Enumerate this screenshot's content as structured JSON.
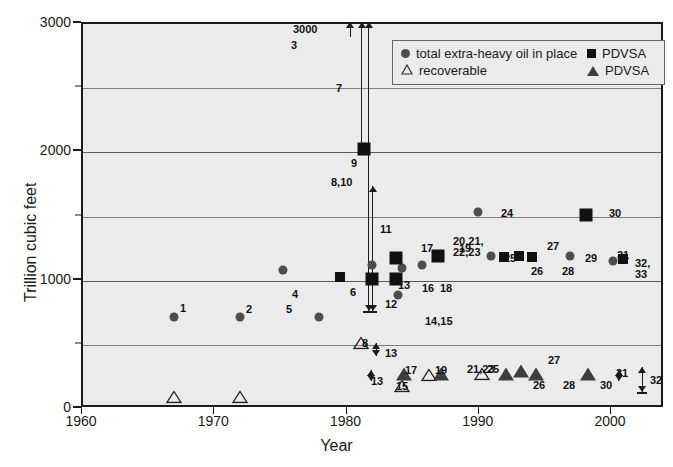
{
  "chart_data": {
    "type": "scatter",
    "title": "",
    "xlabel": "Year",
    "ylabel": "Trillion cubic feet",
    "xlim": [
      1960,
      2004
    ],
    "ylim": [
      0,
      3000
    ],
    "xticks": [
      1960,
      1970,
      1980,
      1990,
      2000
    ],
    "yticks": [
      0,
      1000,
      2000,
      3000
    ],
    "yminor": [
      500,
      1500,
      2500
    ],
    "grid": true,
    "legend_position": "top-right",
    "series": [
      {
        "name": "total extra-heavy oil in place",
        "marker": "circle",
        "points": [
          {
            "ref": "1",
            "x": 1967.0,
            "y": 700
          },
          {
            "ref": "2",
            "x": 1972.0,
            "y": 700
          },
          {
            "ref": "4",
            "x": 1975.3,
            "y": 1065
          },
          {
            "ref": "5",
            "x": 1978.0,
            "y": 700
          },
          {
            "ref": "13",
            "x": 1982.0,
            "y": 1105
          },
          {
            "ref": "18",
            "x": 1984.3,
            "y": 1080
          },
          {
            "ref": "14,15",
            "x": 1984.0,
            "y": 870
          },
          {
            "ref": "19",
            "x": 1985.8,
            "y": 1110
          },
          {
            "ref": "24",
            "x": 1990.0,
            "y": 1520
          },
          {
            "ref": "25",
            "x": 1991.0,
            "y": 1175
          },
          {
            "ref": "29",
            "x": 1997.0,
            "y": 1180
          },
          {
            "ref": "31",
            "x": 2000.2,
            "y": 1140
          }
        ]
      },
      {
        "name": "recoverable",
        "marker": "triangle-open",
        "points": [
          {
            "ref": "1",
            "x": 1967.0,
            "y": 75
          },
          {
            "ref": "2",
            "x": 1972.0,
            "y": 75
          },
          {
            "ref": "8",
            "x": 1981.2,
            "y": 500
          },
          {
            "ref": "15",
            "x": 1984.3,
            "y": 160
          },
          {
            "ref": "19",
            "x": 1986.3,
            "y": 250
          },
          {
            "ref": "25",
            "x": 1990.3,
            "y": 255
          }
        ]
      },
      {
        "name": "PDVSA",
        "marker": "square",
        "points": [
          {
            "ref": "6",
            "x": 1979.6,
            "y": 1010
          },
          {
            "ref": "9",
            "x": 1981.4,
            "y": 2010
          },
          {
            "ref": "12",
            "x": 1982.0,
            "y": 1000
          },
          {
            "ref": "16",
            "x": 1983.8,
            "y": 1000
          },
          {
            "ref": "17",
            "x": 1983.8,
            "y": 1160
          },
          {
            "ref": "20,21,22,23",
            "x": 1987.0,
            "y": 1175
          },
          {
            "ref": "26",
            "x": 1992.0,
            "y": 1165
          },
          {
            "ref": "27",
            "x": 1993.1,
            "y": 1180
          },
          {
            "ref": "28",
            "x": 1994.1,
            "y": 1165
          },
          {
            "ref": "30",
            "x": 1998.2,
            "y": 1500
          },
          {
            "ref": "32,33",
            "x": 2001.0,
            "y": 1155
          }
        ]
      },
      {
        "name": "PDVSA",
        "marker": "triangle-filled",
        "points": [
          {
            "ref": "17",
            "x": 1984.4,
            "y": 255
          },
          {
            "ref": "21,23",
            "x": 1987.2,
            "y": 255
          },
          {
            "ref": "26",
            "x": 1992.1,
            "y": 255
          },
          {
            "ref": "27",
            "x": 1993.3,
            "y": 280
          },
          {
            "ref": "28",
            "x": 1994.4,
            "y": 255
          },
          {
            "ref": "30",
            "x": 1998.3,
            "y": 255
          }
        ]
      }
    ],
    "annotations": [
      {
        "ref": "3",
        "x": 1980.3,
        "y_from": 3000,
        "y_to": 2880,
        "kind": "up-arrow",
        "value_label": "3000"
      },
      {
        "ref": "7",
        "x": 1981.2,
        "y_from": 3000,
        "y_to": 2010,
        "kind": "double-arrow"
      },
      {
        "ref": "8,10",
        "x": 1981.7,
        "y_from": 3000,
        "y_to": 750,
        "kind": "range-bar"
      },
      {
        "ref": "11",
        "x": 1982.0,
        "y_from": 1720,
        "y_to": 750,
        "kind": "range-bar"
      },
      {
        "ref": "13",
        "x": 1982.3,
        "y_from": 500,
        "y_to": 400,
        "kind": "double-arrow"
      },
      {
        "ref": "13",
        "x": 1981.9,
        "y_from": 290,
        "y_to": 200,
        "kind": "double-arrow"
      },
      {
        "ref": "31",
        "x": 2000.6,
        "y_from": 290,
        "y_to": 205,
        "kind": "double-arrow"
      },
      {
        "ref": "32",
        "x": 2002.4,
        "y_from": 310,
        "y_to": 120,
        "kind": "range-bar"
      }
    ]
  },
  "axis": {
    "x_label": "Year",
    "y_label": "Trillion cubic feet",
    "x_ticks": [
      "1960",
      "1970",
      "1980",
      "1990",
      "2000"
    ],
    "y_ticks": [
      "3000",
      "2000",
      "1000",
      "0"
    ]
  },
  "legend": {
    "entries": [
      {
        "icon": "circle-marker-icon",
        "label": "total extra-heavy oil in place"
      },
      {
        "icon": "square-marker-icon",
        "label": "PDVSA"
      },
      {
        "icon": "triangle-open-marker-icon",
        "label": "recoverable"
      },
      {
        "icon": "triangle-filled-marker-icon",
        "label": "PDVSA"
      }
    ]
  },
  "point_labels": [
    {
      "text": "3000",
      "x": 293,
      "y": 24
    },
    {
      "text": "3",
      "x": 291,
      "y": 40
    },
    {
      "text": "7",
      "x": 336,
      "y": 83
    },
    {
      "text": "9",
      "x": 351,
      "y": 158
    },
    {
      "text": "8,10",
      "x": 331,
      "y": 177
    },
    {
      "text": "11",
      "x": 380,
      "y": 224
    },
    {
      "text": "1",
      "x": 180,
      "y": 303
    },
    {
      "text": "2",
      "x": 246,
      "y": 304
    },
    {
      "text": "4",
      "x": 292,
      "y": 289
    },
    {
      "text": "5",
      "x": 286,
      "y": 304
    },
    {
      "text": "6",
      "x": 350,
      "y": 287
    },
    {
      "text": "12",
      "x": 385,
      "y": 299
    },
    {
      "text": "13",
      "x": 398,
      "y": 280
    },
    {
      "text": "16",
      "x": 422,
      "y": 283
    },
    {
      "text": "17",
      "x": 421,
      "y": 243
    },
    {
      "text": "18",
      "x": 440,
      "y": 283
    },
    {
      "text": "19",
      "x": 459,
      "y": 243
    },
    {
      "text": "14,15",
      "x": 425,
      "y": 316
    },
    {
      "text": "20,21,",
      "x": 453,
      "y": 236
    },
    {
      "text": "22,23",
      "x": 453,
      "y": 247
    },
    {
      "text": "24",
      "x": 501,
      "y": 208
    },
    {
      "text": "25",
      "x": 504,
      "y": 253
    },
    {
      "text": "26",
      "x": 531,
      "y": 266
    },
    {
      "text": "27",
      "x": 547,
      "y": 241
    },
    {
      "text": "28",
      "x": 562,
      "y": 266
    },
    {
      "text": "29",
      "x": 585,
      "y": 253
    },
    {
      "text": "30",
      "x": 609,
      "y": 208
    },
    {
      "text": "31",
      "x": 617,
      "y": 250
    },
    {
      "text": "32,",
      "x": 635,
      "y": 258
    },
    {
      "text": "33",
      "x": 635,
      "y": 269
    },
    {
      "text": "8",
      "x": 362,
      "y": 338
    },
    {
      "text": "13",
      "x": 385,
      "y": 348
    },
    {
      "text": "13",
      "x": 371,
      "y": 376
    },
    {
      "text": "17",
      "x": 405,
      "y": 365
    },
    {
      "text": "15",
      "x": 396,
      "y": 381
    },
    {
      "text": "19",
      "x": 435,
      "y": 365
    },
    {
      "text": "21,23",
      "x": 467,
      "y": 364
    },
    {
      "text": "25",
      "x": 487,
      "y": 364
    },
    {
      "text": "26",
      "x": 533,
      "y": 380
    },
    {
      "text": "27",
      "x": 548,
      "y": 355
    },
    {
      "text": "28",
      "x": 563,
      "y": 380
    },
    {
      "text": "30",
      "x": 600,
      "y": 380
    },
    {
      "text": "31",
      "x": 616,
      "y": 368
    },
    {
      "text": "32",
      "x": 650,
      "y": 375
    }
  ]
}
